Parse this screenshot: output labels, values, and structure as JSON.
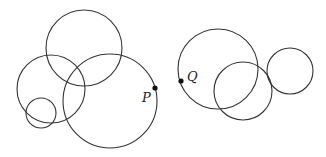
{
  "diagram": {
    "stroke_color": "#333333",
    "groups": [
      {
        "name": "left-group",
        "circles": [
          {
            "cx": 84,
            "cy": 48,
            "r": 38
          },
          {
            "cx": 51,
            "cy": 89,
            "r": 34
          },
          {
            "cx": 41,
            "cy": 113,
            "r": 15
          },
          {
            "cx": 110,
            "cy": 101,
            "r": 47
          }
        ],
        "point": {
          "label": "P",
          "x": 155,
          "y": 88,
          "label_x": 142,
          "label_y": 102
        }
      },
      {
        "name": "right-group",
        "circles": [
          {
            "cx": 218,
            "cy": 69,
            "r": 40
          },
          {
            "cx": 243,
            "cy": 91,
            "r": 29
          },
          {
            "cx": 290,
            "cy": 71,
            "r": 23
          }
        ],
        "point": {
          "label": "Q",
          "x": 181,
          "y": 81,
          "label_x": 187,
          "label_y": 81
        }
      }
    ]
  }
}
